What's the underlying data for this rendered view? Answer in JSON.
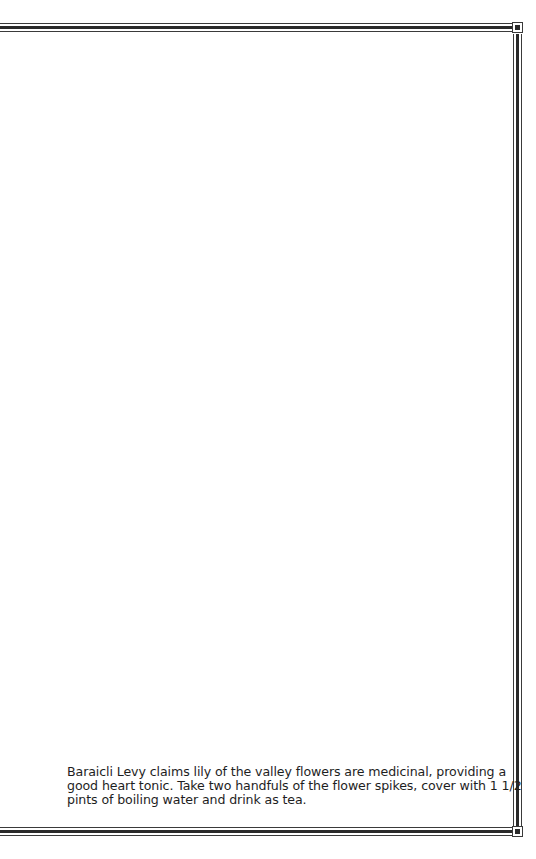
{
  "page": {
    "background": "#ffffff",
    "border_color": "#2a2a2a"
  },
  "caption": {
    "full_text": "Baraicli Levy claims lily of the valley flowers are medicinal, providing a good heart tonic. Take two handfuls of the flower spikes, cover with 1 1/2 pints of boiling water and drink as tea.",
    "lines": [
      "Baraicli Levy claims lily of the valley flowers are medicinal, providing a",
      "good heart tonic. Take two handfuls of the flower spikes, cover with 1 1/2",
      "pints of boiling water and drink as tea."
    ]
  }
}
